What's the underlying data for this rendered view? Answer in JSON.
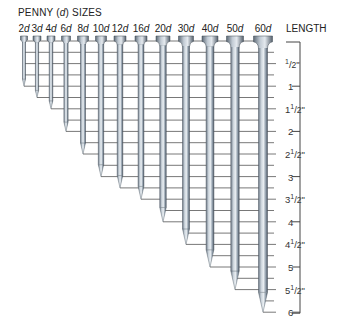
{
  "diagram": {
    "title_prefix": "PENNY (",
    "title_d": "d",
    "title_suffix": ") SIZES",
    "length_header": "LENGTH",
    "colors": {
      "line": "#555555",
      "nail_light": "#d7dde3",
      "nail_mid": "#9aa6b2",
      "nail_dark": "#4f5a66",
      "text": "#222222"
    },
    "scale": {
      "unit": "inch",
      "zero_y": 41,
      "px_per_inch": 45.2,
      "tick_step_in": 0.25,
      "max_in": 6,
      "labels": [
        {
          "value": 0.5,
          "whole": "",
          "frac": "1/2",
          "inch_mark": "\""
        },
        {
          "value": 1,
          "whole": "1",
          "frac": "",
          "inch_mark": ""
        },
        {
          "value": 1.5,
          "whole": "1",
          "frac": "1/2",
          "inch_mark": "\""
        },
        {
          "value": 2,
          "whole": "2",
          "frac": "",
          "inch_mark": ""
        },
        {
          "value": 2.5,
          "whole": "2",
          "frac": "1/2",
          "inch_mark": "\""
        },
        {
          "value": 3,
          "whole": "3",
          "frac": "",
          "inch_mark": ""
        },
        {
          "value": 3.5,
          "whole": "3",
          "frac": "1/2",
          "inch_mark": "\""
        },
        {
          "value": 4,
          "whole": "4",
          "frac": "",
          "inch_mark": ""
        },
        {
          "value": 4.5,
          "whole": "4",
          "frac": "1/2",
          "inch_mark": "\""
        },
        {
          "value": 5,
          "whole": "5",
          "frac": "",
          "inch_mark": ""
        },
        {
          "value": 5.5,
          "whole": "5",
          "frac": "1/2",
          "inch_mark": "\""
        },
        {
          "value": 6,
          "whole": "6",
          "frac": "",
          "inch_mark": ""
        }
      ]
    },
    "nails": [
      {
        "size": "2",
        "unit": "d",
        "length_in": 1.0,
        "x": 24,
        "shank": 3.0,
        "head": 7
      },
      {
        "size": "3",
        "unit": "d",
        "length_in": 1.25,
        "x": 37,
        "shank": 3.2,
        "head": 8
      },
      {
        "size": "4",
        "unit": "d",
        "length_in": 1.5,
        "x": 51,
        "shank": 3.6,
        "head": 8
      },
      {
        "size": "6",
        "unit": "d",
        "length_in": 2.0,
        "x": 66,
        "shank": 4.2,
        "head": 9
      },
      {
        "size": "8",
        "unit": "d",
        "length_in": 2.5,
        "x": 83,
        "shank": 5.0,
        "head": 11
      },
      {
        "size": "10",
        "unit": "d",
        "length_in": 3.0,
        "x": 101,
        "shank": 5.4,
        "head": 11
      },
      {
        "size": "12",
        "unit": "d",
        "length_in": 3.25,
        "x": 120,
        "shank": 5.6,
        "head": 12
      },
      {
        "size": "16",
        "unit": "d",
        "length_in": 3.5,
        "x": 141,
        "shank": 5.8,
        "head": 12
      },
      {
        "size": "20",
        "unit": "d",
        "length_in": 4.0,
        "x": 163,
        "shank": 6.5,
        "head": 14
      },
      {
        "size": "30",
        "unit": "d",
        "length_in": 4.5,
        "x": 186,
        "shank": 7.0,
        "head": 15
      },
      {
        "size": "40",
        "unit": "d",
        "length_in": 5.0,
        "x": 210,
        "shank": 7.8,
        "head": 16
      },
      {
        "size": "50",
        "unit": "d",
        "length_in": 5.5,
        "x": 235,
        "shank": 8.4,
        "head": 17
      },
      {
        "size": "60",
        "unit": "d",
        "length_in": 6.0,
        "x": 263,
        "shank": 9.0,
        "head": 19
      }
    ]
  }
}
